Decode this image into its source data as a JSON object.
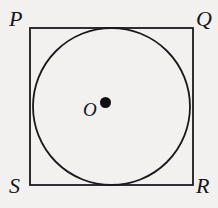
{
  "figure": {
    "background_color": "#f2f1ef",
    "stroke_color": "#1a1a1e",
    "square": {
      "name": "PQRS",
      "x": 30,
      "y": 28,
      "width": 163,
      "height": 157,
      "stroke_width": 1.8
    },
    "circle": {
      "center_x": 111.5,
      "center_y": 106.5,
      "radius": 78.5,
      "stroke_width": 1.8,
      "fill": "none",
      "inscribed_in": "PQRS"
    },
    "center_point": {
      "label": "O",
      "dot_x": 105.5,
      "dot_y": 102.5,
      "dot_radius": 5.5,
      "dot_color": "#101014"
    },
    "vertices": [
      {
        "label": "P",
        "position": "top-left"
      },
      {
        "label": "Q",
        "position": "top-right"
      },
      {
        "label": "R",
        "position": "bottom-right"
      },
      {
        "label": "S",
        "position": "bottom-left"
      }
    ]
  }
}
